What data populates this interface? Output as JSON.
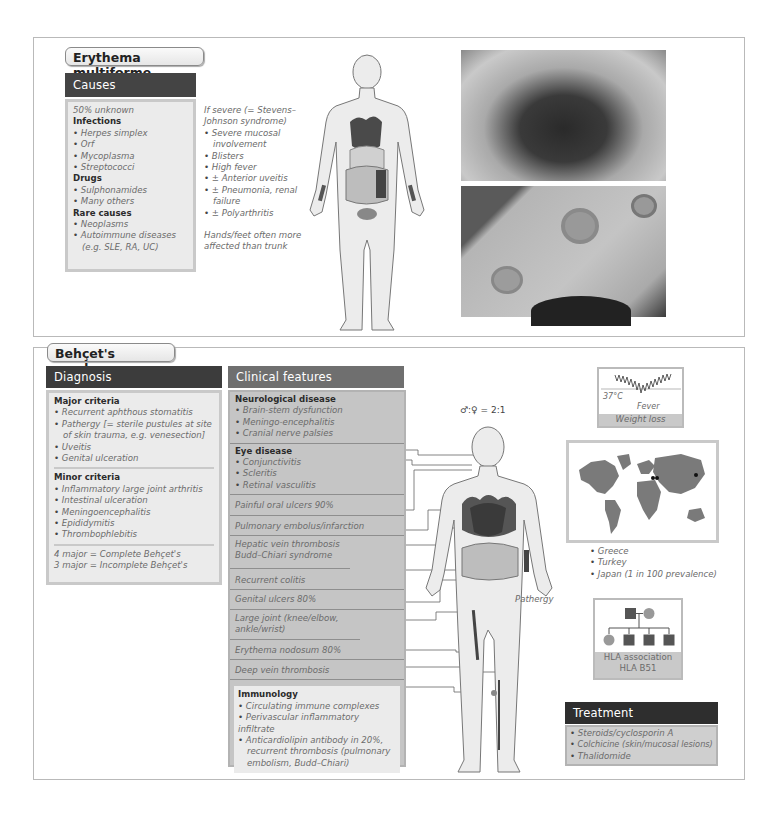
{
  "erythema_multiforme": {
    "title": "Erythema multiforme",
    "causes": {
      "header": "Causes",
      "intro": "50% unknown",
      "groups": [
        {
          "label": "Infections",
          "items": [
            "Herpes simplex",
            "Orf",
            "Mycoplasma",
            "Streptococci"
          ]
        },
        {
          "label": "Drugs",
          "items": [
            "Sulphonamides",
            "Many others"
          ]
        },
        {
          "label": "Rare causes",
          "items": [
            "Neoplasms",
            "Autoimmune diseases (e.g. SLE, RA, UC)"
          ]
        }
      ]
    },
    "severe": {
      "intro_line1": "If severe (= Stevens–",
      "intro_line2": "Johnson syndrome)",
      "items": [
        "Severe mucosal involvement",
        "Blisters",
        "High fever",
        "± Anterior uveitis",
        "± Pneumonia, renal failure",
        "± Polyarthritis"
      ],
      "note_line1": "Hands/feet often more",
      "note_line2": "affected than trunk"
    },
    "photos": [
      {
        "name": "oral-mucosal-lesions-photo"
      },
      {
        "name": "target-lesions-skin-photo"
      }
    ]
  },
  "behcets": {
    "title": "Behçet's syndrome",
    "diagnosis": {
      "header": "Diagnosis",
      "major_label": "Major criteria",
      "major_items": [
        "Recurrent aphthous stomatitis",
        "Pathergy [= sterile pustules at site of skin trauma, e.g. venesection]",
        "Uveitis",
        "Genital ulceration"
      ],
      "minor_label": "Minor criteria",
      "minor_items": [
        "Inflammatory large joint arthritis",
        "Intestinal ulceration",
        "Meningoencephalitis",
        "Epididymitis",
        "Thrombophlebitis"
      ],
      "summary_line1": "4 major = Complete Behçet's",
      "summary_line2": "3 major = Incomplete Behçet's"
    },
    "clinical": {
      "header": "Clinical features",
      "neuro_label": "Neurological disease",
      "neuro_items": [
        "Brain-stem dysfunction",
        "Meningo-encephalitis",
        "Cranial nerve palsies"
      ],
      "eye_label": "Eye disease",
      "eye_items": [
        "Conjunctivitis",
        "Scleritis",
        "Retinal vasculitis"
      ],
      "rows": [
        "Painful oral ulcers 90%",
        "Pulmonary embolus/infarction",
        "Hepatic vein thrombosis Budd–Chiari syndrome",
        "Recurrent colitis",
        "Genital ulcers 80%",
        "Large joint (knee/elbow, ankle/wrist)",
        "Erythema nodosum 80%",
        "Deep vein thrombosis"
      ],
      "immunology_label": "Immunology",
      "immunology_items": [
        "Circulating immune complexes",
        "Perivascular inflammatory infiltrate",
        "Anticardiolipin antibody in 20%, recurrent thrombosis (pulmonary embolism, Budd–Chiari)"
      ]
    },
    "sex_ratio": "♂:♀ = 2:1",
    "pathergy_label": "Pathergy",
    "fever": {
      "temp": "37°C",
      "label": "Fever",
      "sub": "Weight loss"
    },
    "geography": [
      "Greece",
      "Turkey",
      "Japan (1 in 100 prevalence)"
    ],
    "hla": {
      "line1": "HLA association",
      "line2": "HLA B51"
    },
    "treatment": {
      "header": "Treatment",
      "items": [
        "Steroids/cyclosporin A",
        "Colchicine (skin/mucosal lesions)",
        "Thalidomide"
      ]
    }
  }
}
